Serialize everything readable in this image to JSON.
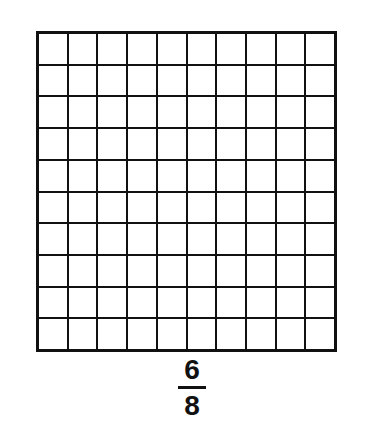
{
  "page": {
    "background_color": "#ffffff",
    "ink_color": "#111111",
    "type": "fraction-grid-worksheet"
  },
  "grid": {
    "name": "hundredths-grid",
    "rows": 10,
    "columns": 10,
    "total_cells": 100,
    "shaded_cells": 0,
    "line_color": "#111111",
    "cell_fill_color": "#ffffff",
    "shaded_indices": []
  },
  "fraction": {
    "numerator": "6",
    "denominator": "8",
    "text": "6/8",
    "bar": "fraction-bar"
  },
  "chart_data": {
    "type": "heatmap",
    "title": "",
    "rows": 10,
    "columns": 10,
    "values": [
      [
        0,
        0,
        0,
        0,
        0,
        0,
        0,
        0,
        0,
        0
      ],
      [
        0,
        0,
        0,
        0,
        0,
        0,
        0,
        0,
        0,
        0
      ],
      [
        0,
        0,
        0,
        0,
        0,
        0,
        0,
        0,
        0,
        0
      ],
      [
        0,
        0,
        0,
        0,
        0,
        0,
        0,
        0,
        0,
        0
      ],
      [
        0,
        0,
        0,
        0,
        0,
        0,
        0,
        0,
        0,
        0
      ],
      [
        0,
        0,
        0,
        0,
        0,
        0,
        0,
        0,
        0,
        0
      ],
      [
        0,
        0,
        0,
        0,
        0,
        0,
        0,
        0,
        0,
        0
      ],
      [
        0,
        0,
        0,
        0,
        0,
        0,
        0,
        0,
        0,
        0
      ],
      [
        0,
        0,
        0,
        0,
        0,
        0,
        0,
        0,
        0,
        0
      ],
      [
        0,
        0,
        0,
        0,
        0,
        0,
        0,
        0,
        0,
        0
      ]
    ],
    "annotations": [
      "6",
      "8"
    ],
    "xlabel": "",
    "ylabel": "",
    "grid": true,
    "legend": "none"
  }
}
